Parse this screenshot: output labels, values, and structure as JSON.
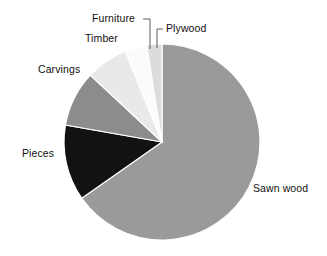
{
  "chart_data": {
    "type": "pie",
    "title": "",
    "subtitle": "",
    "xlabel": "",
    "ylabel": "",
    "legend_position": "none",
    "grid": false,
    "labels_inline": true,
    "categories": [
      "Sawn wood",
      "Pieces",
      "Carvings",
      "Timber",
      "Furniture",
      "Plywood"
    ],
    "values": [
      65.3,
      12.5,
      9.2,
      6.9,
      3.6,
      2.5
    ],
    "units": "percent",
    "slices": [
      {
        "label": "Sawn wood",
        "value": 65.3,
        "angle_deg": 235.0,
        "color": "#9a9a9a"
      },
      {
        "label": "Pieces",
        "value": 12.5,
        "angle_deg": 45.0,
        "color": "#121212"
      },
      {
        "label": "Carvings",
        "value": 9.2,
        "angle_deg": 33.0,
        "color": "#8c8c8c"
      },
      {
        "label": "Timber",
        "value": 6.9,
        "angle_deg": 25.0,
        "color": "#e9e9e9"
      },
      {
        "label": "Furniture",
        "value": 3.6,
        "angle_deg": 13.0,
        "color": "#fbfbfb"
      },
      {
        "label": "Plywood",
        "value": 2.5,
        "angle_deg": 9.0,
        "color": "#dcdcdc"
      }
    ]
  },
  "labels": {
    "sawn_wood": "Sawn wood",
    "pieces": "Pieces",
    "carvings": "Carvings",
    "timber": "Timber",
    "furniture": "Furniture",
    "plywood": "Plywood"
  },
  "colors": {
    "background": "#ffffff",
    "text": "#111111",
    "leader_line": "#4a4a4a",
    "slice_sawn_wood": "#9a9a9a",
    "slice_pieces": "#121212",
    "slice_carvings": "#8c8c8c",
    "slice_timber": "#e9e9e9",
    "slice_furniture": "#fbfbfb",
    "slice_plywood": "#dcdcdc"
  }
}
